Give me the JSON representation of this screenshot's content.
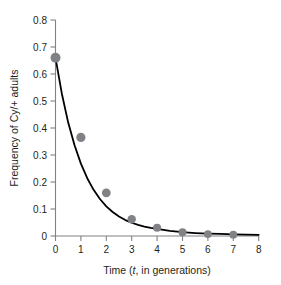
{
  "chart_data": {
    "type": "scatter",
    "title": "",
    "xlabel": "Time (t, in generations)",
    "xlabel_prefix": "Time (",
    "xlabel_italic": "t",
    "xlabel_suffix": ", in generations)",
    "ylabel": "Frequency of Cy/+ adults",
    "x": [
      0,
      1,
      2,
      3,
      4,
      5,
      6,
      7
    ],
    "values": [
      0.66,
      0.365,
      0.16,
      0.062,
      0.031,
      0.014,
      0.007,
      0.005
    ],
    "series": [
      {
        "name": "Frequency of Cy/+ adults",
        "values": [
          0.66,
          0.365,
          0.16,
          0.062,
          0.031,
          0.014,
          0.007,
          0.005
        ],
        "marker": "circle",
        "marker_color": "#808285"
      },
      {
        "name": "fitted exponential decay curve",
        "type": "line",
        "line_color": "#000000",
        "x": [
          0,
          0.25,
          0.5,
          0.75,
          1,
          1.25,
          1.5,
          1.75,
          2,
          2.25,
          2.5,
          2.75,
          3,
          3.25,
          3.5,
          3.75,
          4,
          4.5,
          5,
          5.5,
          6,
          6.5,
          7,
          7.5,
          8
        ],
        "values": [
          0.66,
          0.527,
          0.42,
          0.336,
          0.268,
          0.214,
          0.171,
          0.137,
          0.11,
          0.089,
          0.072,
          0.059,
          0.049,
          0.041,
          0.035,
          0.03,
          0.026,
          0.019,
          0.014,
          0.011,
          0.009,
          0.0075,
          0.006,
          0.005,
          0.0045
        ]
      }
    ],
    "xlim": [
      0,
      8
    ],
    "ylim": [
      0,
      0.8
    ],
    "xticks": [
      "0",
      "1",
      "2",
      "3",
      "4",
      "5",
      "6",
      "7",
      "8"
    ],
    "xtick_values": [
      0,
      1,
      2,
      3,
      4,
      5,
      6,
      7,
      8
    ],
    "yticks": [
      "0",
      "0.1",
      "0.2",
      "0.3",
      "0.4",
      "0.5",
      "0.6",
      "0.7",
      "0.8"
    ],
    "ytick_values": [
      0,
      0.1,
      0.2,
      0.3,
      0.4,
      0.5,
      0.6,
      0.7,
      0.8
    ],
    "grid": false,
    "legend": "none",
    "axis_color": "#808285",
    "curve_color": "#000000",
    "marker_color": "#808285",
    "background": "#ffffff"
  }
}
